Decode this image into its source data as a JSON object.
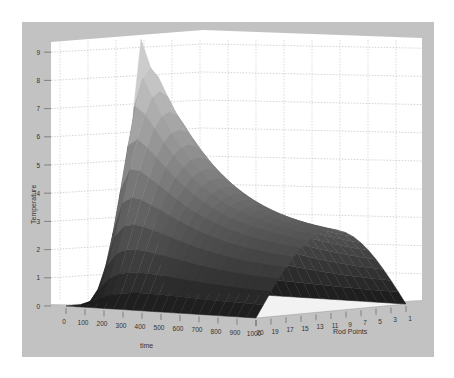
{
  "chart_data": {
    "type": "surface3d",
    "title": "",
    "xlabel": "time",
    "ylabel": "Rod Points",
    "zlabel": "Temperature",
    "x_ticks": [
      "0",
      "100",
      "200",
      "300",
      "400",
      "500",
      "600",
      "700",
      "800",
      "900",
      "1000"
    ],
    "y_ticks": [
      "20",
      "19",
      "17",
      "15",
      "13",
      "11",
      "9",
      "7",
      "5",
      "3",
      "1"
    ],
    "z_ticks": [
      "0",
      "1",
      "2",
      "3",
      "4",
      "5",
      "6",
      "7",
      "8",
      "9"
    ],
    "xlim": [
      0,
      1000
    ],
    "ylim": [
      1,
      20
    ],
    "zlim": [
      0,
      9
    ],
    "grid": true,
    "colormap": "gray",
    "series": [
      {
        "name": "t=0",
        "peak_temperature": 9.2
      },
      {
        "name": "t=100",
        "peak_temperature": 6.4
      },
      {
        "name": "t=200",
        "peak_temperature": 5.4
      },
      {
        "name": "t=300",
        "peak_temperature": 4.8
      },
      {
        "name": "t=400",
        "peak_temperature": 4.3
      },
      {
        "name": "t=500",
        "peak_temperature": 3.9
      },
      {
        "name": "t=600",
        "peak_temperature": 3.6
      },
      {
        "name": "t=700",
        "peak_temperature": 3.3
      },
      {
        "name": "t=800",
        "peak_temperature": 3.0
      },
      {
        "name": "t=900",
        "peak_temperature": 2.8
      },
      {
        "name": "t=1000",
        "peak_temperature": 2.6
      }
    ]
  },
  "colors": {
    "figure_bg": "#c0c0c0",
    "axes_bg": "#ffffff",
    "grid": "#aaaaaa",
    "tick_text": "#333333"
  }
}
